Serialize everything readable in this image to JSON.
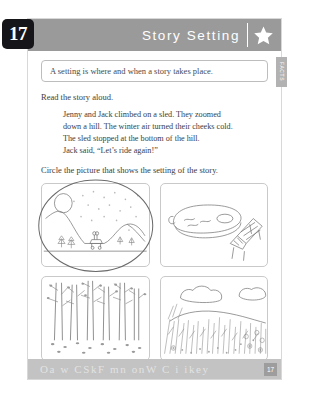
{
  "worksheet": {
    "unit_number": "17",
    "header": {
      "title": "Story Setting",
      "star_icon": "star-icon"
    },
    "side_tab": {
      "label": "FACTS"
    },
    "definition": "A setting is where and when a story takes place.",
    "read_instruction": "Read the story aloud.",
    "story_lines": [
      "Jenny and Jack climbed on a sled. They zoomed",
      "down a hill. The winter air turned their cheeks cold.",
      "The sled stopped at the bottom of the hill.",
      "Jack said, “Let’s ride again!”"
    ],
    "circle_instruction": "Circle the picture that shows the setting of the story.",
    "pictures": [
      {
        "name": "snowy-hill-scene",
        "selected": true
      },
      {
        "name": "swimming-pool-scene",
        "selected": false
      },
      {
        "name": "forest-scene",
        "selected": false
      },
      {
        "name": "grassy-field-scene",
        "selected": false
      }
    ],
    "footer": {
      "decorative_letters": "Oa w CSkF mn onW C i ikey",
      "page_number": "17"
    },
    "colors": {
      "header_bar": "#9a9a9a",
      "footer_bar": "#c3c3c3",
      "unit_tab": "#16161a",
      "side_tab": "#b2b2b2",
      "ink": "#3d3d3d"
    }
  }
}
